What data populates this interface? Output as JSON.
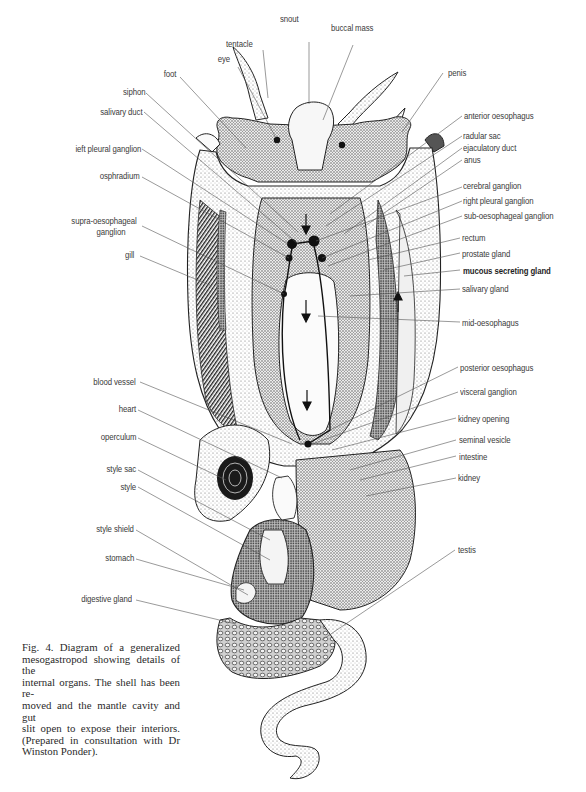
{
  "figure": {
    "number": "Fig. 4.",
    "caption_lines": [
      "Fig. 4.  Diagram of a generalized",
      "mesogastropod showing details of the",
      "internal organs. The shell has been re-",
      "moved and the mantle cavity and gut",
      "slit open to expose their interiors.",
      "(Prepared in consultation with Dr",
      "Winston Ponder)."
    ]
  },
  "labels": {
    "top": {
      "tentacle": "tentacle",
      "snout": "snout",
      "buccal_mass": "buccal mass",
      "eye": "eye",
      "foot": "foot",
      "penis": "penis"
    },
    "left": {
      "siphon": "siphon",
      "salivary_duct": "salivary duct",
      "left_pleural_ganglion": "ieft pleural ganglion",
      "osphradium": "osphradium",
      "supra_oesophageal_ganglion_1": "supra-oesophageal",
      "supra_oesophageal_ganglion_2": "ganglion",
      "gill": "gill",
      "blood_vessel": "blood vessel",
      "heart": "heart",
      "operculum": "operculum",
      "style_sac": "style sac",
      "style": "style",
      "style_shield": "style shield",
      "stomach": "stomach",
      "digestive_gland": "digestive gland"
    },
    "right": {
      "anterior_oesophagus": "anterior oesophagus",
      "radular_sac": "radular sac",
      "ejaculatory_duct": "ejaculatory duct",
      "anus": "anus",
      "cerebral_ganglion": "cerebral ganglion",
      "right_pleural_ganglion": "right pleural ganglion",
      "sub_oesophageal_ganglion": "sub-oesophageal ganglion",
      "rectum": "rectum",
      "prostate_gland": "prostate gland",
      "mucous_secreting_gland": "mucous secreting gland",
      "salivary_gland": "salivary gland",
      "mid_oesophagus": "mid-oesophagus",
      "posterior_oesophagus": "posterior oesophagus",
      "visceral_ganglion": "visceral ganglion",
      "kidney_opening": "kidney opening",
      "seminal_vesicle": "seminal vesicle",
      "intestine": "intestine",
      "kidney": "kidney",
      "testis": "testis"
    }
  },
  "colors": {
    "ink": "#1a1a1a",
    "leader": "#555555",
    "stipple_light": "#dcdcdc",
    "stipple_mid": "#b8b8b8",
    "stipple_dark": "#8a8a8a",
    "paper": "#ffffff"
  }
}
